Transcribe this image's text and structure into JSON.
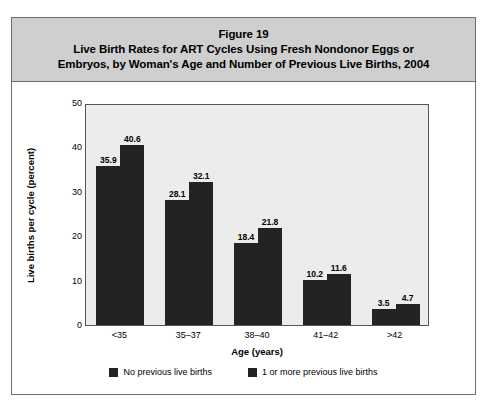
{
  "figure": {
    "title_lines": [
      "Figure 19",
      "Live Birth Rates for ART Cycles Using Fresh Nondonor Eggs or",
      "Embryos, by Woman's Age and Number of Previous Live Births, 2004"
    ]
  },
  "colors": {
    "bar": "#232323",
    "plot_background": "#ececec",
    "title_band": "#cfcfcf",
    "frame_border": "#6d6d6d"
  },
  "chart_data": {
    "type": "bar",
    "xlabel": "Age (years)",
    "ylabel": "Live births per cycle (percent)",
    "categories": [
      "<35",
      "35–37",
      "38–40",
      "41–42",
      ">42"
    ],
    "series": [
      {
        "name": "No previous live births",
        "values": [
          35.9,
          28.1,
          18.4,
          10.2,
          3.5
        ]
      },
      {
        "name": "1 or more previous live births",
        "values": [
          40.6,
          32.1,
          21.8,
          11.6,
          4.7
        ]
      }
    ],
    "ylim": [
      0,
      50
    ],
    "yticks": [
      0,
      10,
      20,
      30,
      40,
      50
    ],
    "ytick_labels": [
      "0",
      "10",
      "20",
      "30",
      "40",
      "50"
    ],
    "grid": false,
    "legend_position": "bottom",
    "data_labels": true
  }
}
